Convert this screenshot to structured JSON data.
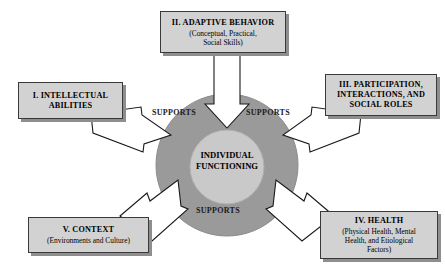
{
  "figure": {
    "center": {
      "label": "INDIVIDUAL\nFUNCTIONING"
    },
    "supports": {
      "left_label": "SUPPORTS",
      "right_label": "SUPPORTS",
      "bottom_label": "SUPPORTS"
    },
    "boxes": [
      {
        "id": "intellectual-abilities",
        "title": "I.  INTELLECTUAL\nABILITIES",
        "subtitle": ""
      },
      {
        "id": "adaptive-behavior",
        "title": "II.  ADAPTIVE BEHAVIOR",
        "subtitle": "(Conceptual, Practical,\nSocial Skills)"
      },
      {
        "id": "participation-interactions-social-roles",
        "title": "III.  PARTICIPATION,\nINTERACTIONS, AND\nSOCIAL ROLES",
        "subtitle": ""
      },
      {
        "id": "health",
        "title": "IV.  HEALTH",
        "subtitle": "(Physical Health, Mental\nHealth, and Etiological\nFactors)"
      },
      {
        "id": "context",
        "title": "V.  CONTEXT",
        "subtitle": "(Environments and Culture)"
      }
    ],
    "colors": {
      "outer_circle": "#9a9a9a",
      "inner_circle": "#c9c9c9",
      "box_fill": "#d2d2d2",
      "box_border": "#3a3a3a",
      "box_shadow": "#8e8e8e",
      "arrow_fill": "#ffffff",
      "arrow_stroke": "#1a1a1a",
      "background": "#ffffff"
    }
  }
}
